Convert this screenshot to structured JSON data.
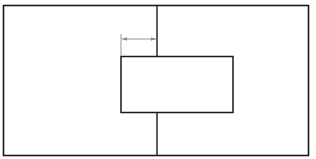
{
  "diagram": {
    "colors": {
      "line": "#1a1a1a",
      "dimension": "#8a8a8a",
      "background": "#ffffff"
    },
    "outer_rect": {
      "x": 3,
      "y": 5,
      "w": 306,
      "h": 151
    },
    "center_line": {
      "x": 157,
      "y1": 5,
      "y2": 156
    },
    "inner_rect": {
      "x": 121,
      "y": 56,
      "w": 112,
      "h": 56
    },
    "dimension": {
      "x1": 121,
      "x2": 156,
      "y": 39,
      "ext_y1": 34,
      "ext_y2": 56,
      "label": ""
    }
  }
}
